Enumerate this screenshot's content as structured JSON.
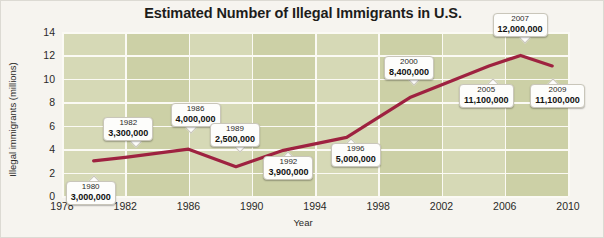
{
  "chart_data": {
    "type": "line",
    "title": "Estimated Number of Illegal Immigrants in U.S.",
    "xlabel": "Year",
    "ylabel": "Illegal immigrants (millions)",
    "xlim": [
      1978,
      2010
    ],
    "ylim": [
      0,
      14
    ],
    "grid": true,
    "legend": "none",
    "x_ticks": [
      "1978",
      "1982",
      "1986",
      "1990",
      "1994",
      "1998",
      "2002",
      "2006",
      "2010"
    ],
    "y_ticks": [
      "0",
      "2",
      "4",
      "6",
      "8",
      "10",
      "12",
      "14"
    ],
    "series": [
      {
        "name": "Estimated illegal immigrants",
        "color": "#9e2240",
        "x": [
          1980,
          1982,
          1986,
          1989,
          1992,
          1996,
          2000,
          2005,
          2007,
          2009
        ],
        "values": [
          3.0,
          3.3,
          4.0,
          2.5,
          3.9,
          5.0,
          8.4,
          11.1,
          12.0,
          11.1
        ]
      }
    ],
    "annotations": [
      {
        "year": "1980",
        "value": "3,000,000",
        "x": 1980,
        "y": 3.0
      },
      {
        "year": "1982",
        "value": "3,300,000",
        "x": 1982,
        "y": 3.3
      },
      {
        "year": "1986",
        "value": "4,000,000",
        "x": 1986,
        "y": 4.0
      },
      {
        "year": "1989",
        "value": "2,500,000",
        "x": 1989,
        "y": 2.5
      },
      {
        "year": "1992",
        "value": "3,900,000",
        "x": 1992,
        "y": 3.9
      },
      {
        "year": "1996",
        "value": "5,000,000",
        "x": 1996,
        "y": 5.0
      },
      {
        "year": "2000",
        "value": "8,400,000",
        "x": 2000,
        "y": 8.4
      },
      {
        "year": "2005",
        "value": "11,100,000",
        "x": 2005,
        "y": 11.1
      },
      {
        "year": "2007",
        "value": "12,000,000",
        "x": 2007,
        "y": 12.0
      },
      {
        "year": "2009",
        "value": "11,100,000",
        "x": 2009,
        "y": 11.1
      }
    ]
  },
  "colors": {
    "page_background": "#f6f4ef",
    "plot_background": "#ccd0a6",
    "plot_band": "#d6d9b6",
    "gridline": "#fbfaf4",
    "line": "#9e2240",
    "text": "#1d1d1b"
  }
}
